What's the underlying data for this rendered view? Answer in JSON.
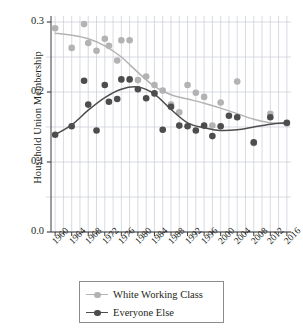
{
  "chart_data": {
    "type": "scatter",
    "title": "",
    "subtitle": "",
    "xlabel": "",
    "ylabel": "Household Union Membership",
    "xlim": [
      1959,
      2017
    ],
    "ylim": [
      0.0,
      0.31
    ],
    "yticks": [
      "0.0",
      "0.1",
      "0.2",
      "0.3"
    ],
    "ytick_values": [
      0.0,
      0.1,
      0.2,
      0.3
    ],
    "xticks": [
      "1960",
      "1964",
      "1968",
      "1972",
      "1976",
      "1980",
      "1984",
      "1988",
      "1992",
      "1996",
      "2000",
      "2004",
      "2008",
      "2012",
      "2016"
    ],
    "xtick_values": [
      1960,
      1964,
      1968,
      1972,
      1976,
      1980,
      1984,
      1988,
      1992,
      1996,
      2000,
      2004,
      2008,
      2012,
      2016
    ],
    "xminor_step": 2,
    "grid": "vertical-and-horizontal",
    "legend_position": "below-axes",
    "series": [
      {
        "name": "White Working Class",
        "color": "#b3b3b3",
        "marker": "circle",
        "points": [
          {
            "x": 1960,
            "y": 0.291
          },
          {
            "x": 1964,
            "y": 0.263
          },
          {
            "x": 1967,
            "y": 0.297
          },
          {
            "x": 1968,
            "y": 0.27
          },
          {
            "x": 1970,
            "y": 0.259
          },
          {
            "x": 1972,
            "y": 0.276
          },
          {
            "x": 1973,
            "y": 0.266
          },
          {
            "x": 1975,
            "y": 0.245
          },
          {
            "x": 1976,
            "y": 0.274
          },
          {
            "x": 1978,
            "y": 0.274
          },
          {
            "x": 1980,
            "y": 0.217
          },
          {
            "x": 1982,
            "y": 0.222
          },
          {
            "x": 1984,
            "y": 0.21
          },
          {
            "x": 1986,
            "y": 0.202
          },
          {
            "x": 1988,
            "y": 0.182
          },
          {
            "x": 1990,
            "y": 0.171
          },
          {
            "x": 1992,
            "y": 0.21
          },
          {
            "x": 1994,
            "y": 0.199
          },
          {
            "x": 1996,
            "y": 0.193
          },
          {
            "x": 1998,
            "y": 0.152
          },
          {
            "x": 2000,
            "y": 0.185
          },
          {
            "x": 2004,
            "y": 0.215
          },
          {
            "x": 2008,
            "y": 0.127
          },
          {
            "x": 2012,
            "y": 0.169
          },
          {
            "x": 2016,
            "y": 0.155
          }
        ],
        "smooth_line": [
          {
            "x": 1960,
            "y": 0.284
          },
          {
            "x": 1964,
            "y": 0.281
          },
          {
            "x": 1968,
            "y": 0.276
          },
          {
            "x": 1972,
            "y": 0.266
          },
          {
            "x": 1976,
            "y": 0.25
          },
          {
            "x": 1980,
            "y": 0.228
          },
          {
            "x": 1984,
            "y": 0.208
          },
          {
            "x": 1988,
            "y": 0.196
          },
          {
            "x": 1992,
            "y": 0.19
          },
          {
            "x": 1996,
            "y": 0.184
          },
          {
            "x": 2000,
            "y": 0.177
          },
          {
            "x": 2004,
            "y": 0.169
          },
          {
            "x": 2008,
            "y": 0.161
          },
          {
            "x": 2012,
            "y": 0.156
          },
          {
            "x": 2016,
            "y": 0.155
          }
        ]
      },
      {
        "name": "Everyone Else",
        "color": "#4d4d4d",
        "marker": "circle",
        "points": [
          {
            "x": 1960,
            "y": 0.139
          },
          {
            "x": 1964,
            "y": 0.151
          },
          {
            "x": 1967,
            "y": 0.216
          },
          {
            "x": 1968,
            "y": 0.182
          },
          {
            "x": 1970,
            "y": 0.145
          },
          {
            "x": 1972,
            "y": 0.21
          },
          {
            "x": 1973,
            "y": 0.186
          },
          {
            "x": 1975,
            "y": 0.19
          },
          {
            "x": 1976,
            "y": 0.218
          },
          {
            "x": 1978,
            "y": 0.218
          },
          {
            "x": 1980,
            "y": 0.204
          },
          {
            "x": 1982,
            "y": 0.191
          },
          {
            "x": 1984,
            "y": 0.198
          },
          {
            "x": 1986,
            "y": 0.146
          },
          {
            "x": 1988,
            "y": 0.179
          },
          {
            "x": 1990,
            "y": 0.152
          },
          {
            "x": 1992,
            "y": 0.151
          },
          {
            "x": 1994,
            "y": 0.145
          },
          {
            "x": 1996,
            "y": 0.152
          },
          {
            "x": 1998,
            "y": 0.137
          },
          {
            "x": 2000,
            "y": 0.151
          },
          {
            "x": 2002,
            "y": 0.166
          },
          {
            "x": 2004,
            "y": 0.164
          },
          {
            "x": 2008,
            "y": 0.128
          },
          {
            "x": 2012,
            "y": 0.164
          },
          {
            "x": 2016,
            "y": 0.156
          }
        ],
        "smooth_line": [
          {
            "x": 1960,
            "y": 0.139
          },
          {
            "x": 1964,
            "y": 0.153
          },
          {
            "x": 1968,
            "y": 0.174
          },
          {
            "x": 1972,
            "y": 0.192
          },
          {
            "x": 1976,
            "y": 0.204
          },
          {
            "x": 1980,
            "y": 0.207
          },
          {
            "x": 1984,
            "y": 0.197
          },
          {
            "x": 1988,
            "y": 0.175
          },
          {
            "x": 1992,
            "y": 0.156
          },
          {
            "x": 1996,
            "y": 0.149
          },
          {
            "x": 2000,
            "y": 0.145
          },
          {
            "x": 2004,
            "y": 0.146
          },
          {
            "x": 2008,
            "y": 0.15
          },
          {
            "x": 2012,
            "y": 0.154
          },
          {
            "x": 2016,
            "y": 0.156
          }
        ]
      }
    ],
    "legend": [
      {
        "label": "White Working Class",
        "color": "#b3b3b3"
      },
      {
        "label": "Everyone Else",
        "color": "#4d4d4d"
      }
    ]
  },
  "colors": {
    "grid": "#c9cbd6",
    "axis": "#3a3a3a",
    "text": "#231f20",
    "background": "#ffffff",
    "legend_border": "#8c8c8c"
  }
}
